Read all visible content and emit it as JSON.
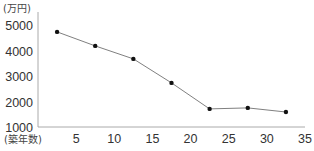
{
  "chart_data": {
    "type": "line",
    "title": "",
    "ylabel": "(万円)",
    "xlabel": "(築年数)",
    "x": [
      2.5,
      7.5,
      12.5,
      17.5,
      22.5,
      27.5,
      32.5
    ],
    "series": [
      {
        "name": "price",
        "values": [
          4730,
          4180,
          3670,
          2730,
          1710,
          1750,
          1590
        ]
      }
    ],
    "xlim": [
      0,
      35
    ],
    "ylim": [
      1000,
      5000
    ],
    "xticks": [
      5,
      10,
      15,
      20,
      25,
      30,
      35
    ],
    "yticks": [
      1000,
      2000,
      3000,
      4000,
      5000
    ],
    "grid": false,
    "legend": null,
    "colors": {
      "line": "#808080",
      "marker": "#111111",
      "axis": "#aaaaaa",
      "text": "#333333"
    }
  },
  "labels": {
    "y_unit": "(万円)",
    "x_unit": "(築年数)"
  }
}
